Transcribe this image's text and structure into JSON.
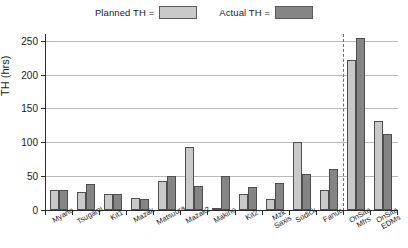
{
  "chart_data": {
    "type": "bar",
    "title": "",
    "subtitle": "",
    "xlabel": "",
    "ylabel": "TH (hrs)",
    "ylim": [
      0,
      260
    ],
    "yticks": [
      0,
      50,
      100,
      150,
      200,
      250
    ],
    "ytick_labels": [
      "0",
      "50",
      "100",
      "150",
      "200",
      "250"
    ],
    "grid": true,
    "legend_position": "top-center",
    "categories": [
      "Myano",
      "Tsugami",
      "Kit1",
      "Mazak",
      "Matsuura",
      "Mazak2",
      "Makino",
      "Kit2",
      "Mzk Saxis",
      "Sodick",
      "Fanuc",
      "OnSite Mfrs",
      "OnSite EDMs"
    ],
    "category_lines": [
      [
        "Myano"
      ],
      [
        "Tsugami"
      ],
      [
        "Kit1"
      ],
      [
        "Mazak"
      ],
      [
        "Matsuura"
      ],
      [
        "Mazak2"
      ],
      [
        "Makino"
      ],
      [
        "Kit2"
      ],
      [
        "Mzk",
        "Saxis"
      ],
      [
        "Sodick"
      ],
      [
        "Fanuc"
      ],
      [
        "OnSite",
        "Mfrs"
      ],
      [
        "OnSite",
        "EDMs"
      ]
    ],
    "series": [
      {
        "name": "Planned TH",
        "color": "#c9c9c9",
        "values": [
          29,
          27,
          24,
          18,
          43,
          93,
          1,
          24,
          16,
          101,
          30,
          221,
          131
        ]
      },
      {
        "name": "Actual TH",
        "color": "#858585",
        "values": [
          29,
          39,
          24,
          17,
          50,
          35,
          50,
          34,
          40,
          53,
          60,
          254,
          113
        ]
      }
    ],
    "annotations": [
      {
        "type": "vertical-dashed-line",
        "between_categories": [
          "Fanuc",
          "OnSite Mfrs"
        ],
        "color": "#6f6f6f"
      }
    ]
  },
  "legend": {
    "items": [
      {
        "label": "Planned TH =",
        "swatch_class": "sw-planned",
        "color": "#c9c9c9"
      },
      {
        "label": "Actual TH =",
        "swatch_class": "sw-actual",
        "color": "#858585"
      }
    ]
  },
  "axes": {
    "y_title": "TH (hrs)"
  }
}
